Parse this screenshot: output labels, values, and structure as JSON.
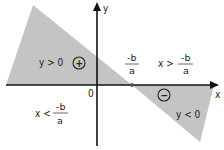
{
  "diagram": {
    "type": "sign-of-linear-function",
    "colors": {
      "shade": "#c4c4c4",
      "axis": "#111111",
      "text": "#222222",
      "background": "#ffffff"
    },
    "axes": {
      "x_label": "x",
      "y_label": "y",
      "origin_label": "0"
    },
    "root": {
      "numerator": "-b",
      "denominator": "a"
    },
    "regions": {
      "positive": {
        "condition": "y > 0",
        "sign_symbol": "+",
        "domain_prefix": "x <",
        "domain_numerator": "-b",
        "domain_denominator": "a"
      },
      "negative": {
        "condition": "y < 0",
        "sign_symbol": "−",
        "domain_prefix": "x >",
        "domain_numerator": "-b",
        "domain_denominator": "a"
      }
    }
  }
}
